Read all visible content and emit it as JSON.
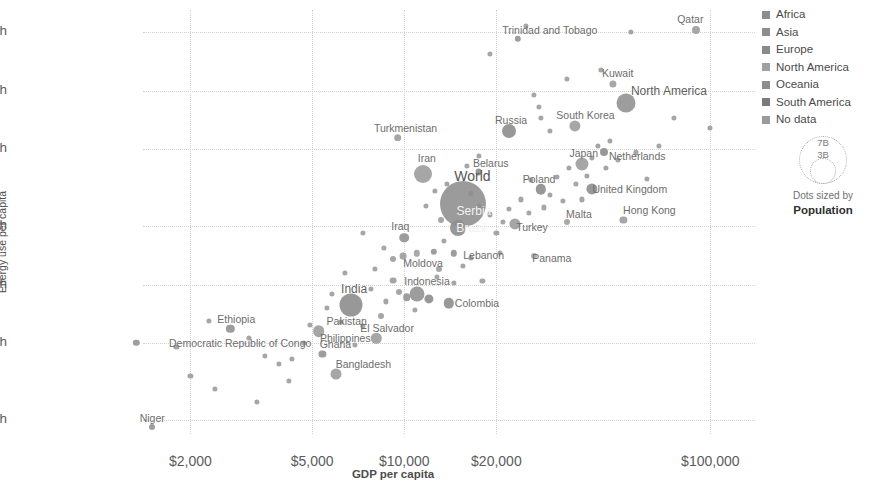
{
  "chart_data": {
    "type": "scatter",
    "title": "",
    "xlabel": "GDP per capita",
    "ylabel": "Energy use per capita",
    "xscale": "log",
    "yscale": "log",
    "xlim": [
      1400,
      140000
    ],
    "ylim": [
      1700,
      260000
    ],
    "grid": true,
    "xticks": [
      "$2,000",
      "$5,000",
      "$10,000",
      "$20,000",
      "$100,000"
    ],
    "xtick_values": [
      2000,
      5000,
      10000,
      20000,
      100000
    ],
    "yticks": [
      "200,000 kWh",
      "100,000 kWh",
      "50,000 kWh",
      "20,000 kWh",
      "10,000 kWh",
      "5,000 kWh",
      "2,000 kWh"
    ],
    "ytick_values": [
      200000,
      100000,
      50000,
      20000,
      10000,
      5000,
      2000
    ],
    "size_encoding": "Population",
    "legend_position": "right",
    "points": [
      {
        "label": "Niger",
        "x": 1500,
        "y": 1850,
        "r": 3.0,
        "c": "#8f8f8f",
        "lx": 0,
        "ly": -9
      },
      {
        "label": "Democratic Republic of Congo",
        "x": 1330,
        "y": 5000,
        "r": 3.2,
        "c": "#8f8f8f",
        "lx": 104,
        "ly": 0
      },
      {
        "label": "Ethiopia",
        "x": 2700,
        "y": 5900,
        "r": 4.2,
        "c": "#8f8f8f",
        "lx": 6,
        "ly": -10
      },
      {
        "label": "Bangladesh",
        "x": 6000,
        "y": 3450,
        "r": 5.5,
        "c": "#9a9a9a",
        "lx": 27,
        "ly": -10
      },
      {
        "label": "Ghana",
        "x": 5400,
        "y": 4400,
        "r": 3.6,
        "c": "#8f8f8f",
        "lx": 13,
        "ly": -10
      },
      {
        "label": "Pakistan",
        "x": 5250,
        "y": 5750,
        "r": 5.8,
        "c": "#9a9a9a",
        "lx": 28,
        "ly": -10
      },
      {
        "label": "India",
        "x": 6700,
        "y": 7900,
        "r": 11.5,
        "c": "#8a8a8a",
        "lx": 3,
        "ly": -16
      },
      {
        "label": "Philippines",
        "x": 8100,
        "y": 5300,
        "r": 5.2,
        "c": "#9a9a9a",
        "lx": -31,
        "ly": 0
      },
      {
        "label": "El Salvador",
        "x": 8400,
        "y": 6900,
        "r": 3.0,
        "c": "#9a9a9a",
        "lx": 6,
        "ly": 12
      },
      {
        "label": "Indonesia",
        "x": 11000,
        "y": 9000,
        "r": 7.5,
        "c": "#8f8f8f",
        "lx": 10,
        "ly": -13
      },
      {
        "label": "Colombia",
        "x": 14000,
        "y": 8000,
        "r": 5.2,
        "c": "#8a8a8a",
        "lx": 28,
        "ly": 0
      },
      {
        "label": "Moldova",
        "x": 11000,
        "y": 14500,
        "r": 3.2,
        "c": "#9d9d9d",
        "lx": 6,
        "ly": 10
      },
      {
        "label": "Iraq",
        "x": 10000,
        "y": 17500,
        "r": 4.8,
        "c": "#8f8f8f",
        "lx": -4,
        "ly": -12
      },
      {
        "label": "Lebanon",
        "x": 14500,
        "y": 14500,
        "r": 3.2,
        "c": "#8f8f8f",
        "lx": 30,
        "ly": 2
      },
      {
        "label": "Brazil",
        "x": 15000,
        "y": 19500,
        "r": 8.0,
        "c": "#8a8a8a",
        "lx": 13,
        "ly": 0
      },
      {
        "label": "Serbia",
        "x": 15200,
        "y": 24000,
        "r": 3.0,
        "c": "#9d9d9d",
        "lx": 14,
        "ly": 0
      },
      {
        "label": "World",
        "x": 15500,
        "y": 26000,
        "r": 23.0,
        "c": "#8d8d8d",
        "lx": 10,
        "ly": -28
      },
      {
        "label": "Iran",
        "x": 11500,
        "y": 37000,
        "r": 9.0,
        "c": "#9a9a9a",
        "lx": 4,
        "ly": -16
      },
      {
        "label": "Belarus",
        "x": 17500,
        "y": 38000,
        "r": 3.4,
        "c": "#8a8a8a",
        "lx": 12,
        "ly": -9
      },
      {
        "label": "Turkey",
        "x": 23000,
        "y": 20500,
        "r": 5.6,
        "c": "#9a9a9a",
        "lx": 17,
        "ly": 3
      },
      {
        "label": "Panama",
        "x": 26500,
        "y": 14000,
        "r": 3.0,
        "c": "#a5a5a5",
        "lx": 18,
        "ly": 2
      },
      {
        "label": "Malta",
        "x": 34000,
        "y": 21000,
        "r": 3.0,
        "c": "#9d9d9d",
        "lx": 12,
        "ly": -8
      },
      {
        "label": "Poland",
        "x": 28000,
        "y": 31000,
        "r": 5.2,
        "c": "#8a8a8a",
        "lx": -2,
        "ly": -10
      },
      {
        "label": "Turkmenistan",
        "x": 9500,
        "y": 57000,
        "r": 3.8,
        "c": "#9a9a9a",
        "lx": 8,
        "ly": -10
      },
      {
        "label": "Russia",
        "x": 22000,
        "y": 62000,
        "r": 7.0,
        "c": "#8a8a8a",
        "lx": 2,
        "ly": -11
      },
      {
        "label": "South Korea",
        "x": 36000,
        "y": 66000,
        "r": 5.6,
        "c": "#9a9a9a",
        "lx": 11,
        "ly": -11
      },
      {
        "label": "Netherlands",
        "x": 45000,
        "y": 48000,
        "r": 4.0,
        "c": "#8a8a8a",
        "lx": 33,
        "ly": 4
      },
      {
        "label": "Japan",
        "x": 38000,
        "y": 42000,
        "r": 6.5,
        "c": "#9a9a9a",
        "lx": 2,
        "ly": -11
      },
      {
        "label": "United Kingdom",
        "x": 41000,
        "y": 31000,
        "r": 5.6,
        "c": "#8a8a8a",
        "lx": 38,
        "ly": 0
      },
      {
        "label": "Hong Kong",
        "x": 52000,
        "y": 21500,
        "r": 3.6,
        "c": "#9a9a9a",
        "lx": 26,
        "ly": -10
      },
      {
        "label": "North America",
        "x": 53000,
        "y": 86000,
        "r": 9.5,
        "c": "#909090",
        "lx": 43,
        "ly": -12
      },
      {
        "label": "Kuwait",
        "x": 48000,
        "y": 108000,
        "r": 3.6,
        "c": "#9a9a9a",
        "lx": 5,
        "ly": -11
      },
      {
        "label": "Trinidad and Tobago",
        "x": 23500,
        "y": 185000,
        "r": 3.2,
        "c": "#8f8f8f",
        "lx": 32,
        "ly": -9
      },
      {
        "label": "Qatar",
        "x": 90000,
        "y": 205000,
        "r": 4.0,
        "c": "#9a9a9a",
        "lx": -6,
        "ly": -11
      }
    ],
    "unlabeled_points": [
      {
        "x": 1800,
        "y": 4800,
        "r": 2.6,
        "c": "#9a9a9a"
      },
      {
        "x": 2300,
        "y": 6500,
        "r": 2.6,
        "c": "#9a9a9a"
      },
      {
        "x": 3100,
        "y": 5300,
        "r": 2.6,
        "c": "#9a9a9a"
      },
      {
        "x": 3500,
        "y": 4300,
        "r": 2.6,
        "c": "#9a9a9a"
      },
      {
        "x": 3900,
        "y": 3900,
        "r": 2.6,
        "c": "#9a9a9a"
      },
      {
        "x": 4300,
        "y": 4150,
        "r": 2.6,
        "c": "#9a9a9a"
      },
      {
        "x": 4200,
        "y": 3200,
        "r": 2.6,
        "c": "#9a9a9a"
      },
      {
        "x": 4700,
        "y": 5000,
        "r": 2.6,
        "c": "#9a9a9a"
      },
      {
        "x": 4900,
        "y": 6200,
        "r": 2.6,
        "c": "#9a9a9a"
      },
      {
        "x": 5600,
        "y": 7600,
        "r": 2.6,
        "c": "#9a9a9a"
      },
      {
        "x": 6200,
        "y": 6400,
        "r": 2.6,
        "c": "#9a9a9a"
      },
      {
        "x": 6900,
        "y": 4900,
        "r": 2.6,
        "c": "#9a9a9a"
      },
      {
        "x": 7300,
        "y": 6100,
        "r": 2.6,
        "c": "#9a9a9a"
      },
      {
        "x": 7800,
        "y": 9500,
        "r": 2.6,
        "c": "#9a9a9a"
      },
      {
        "x": 8700,
        "y": 8200,
        "r": 2.6,
        "c": "#9a9a9a"
      },
      {
        "x": 9200,
        "y": 10500,
        "r": 3.4,
        "c": "#9a9a9a"
      },
      {
        "x": 9600,
        "y": 9200,
        "r": 3.0,
        "c": "#9a9a9a"
      },
      {
        "x": 10200,
        "y": 8600,
        "r": 3.8,
        "c": "#8f8f8f"
      },
      {
        "x": 10800,
        "y": 7400,
        "r": 2.6,
        "c": "#9a9a9a"
      },
      {
        "x": 12000,
        "y": 8400,
        "r": 4.6,
        "c": "#8a8a8a"
      },
      {
        "x": 12800,
        "y": 11000,
        "r": 2.6,
        "c": "#9a9a9a"
      },
      {
        "x": 9200,
        "y": 13500,
        "r": 3.0,
        "c": "#9a9a9a"
      },
      {
        "x": 8600,
        "y": 15500,
        "r": 2.6,
        "c": "#9a9a9a"
      },
      {
        "x": 9900,
        "y": 14000,
        "r": 3.4,
        "c": "#9a9a9a"
      },
      {
        "x": 12500,
        "y": 14800,
        "r": 3.2,
        "c": "#8f8f8f"
      },
      {
        "x": 13500,
        "y": 16800,
        "r": 2.6,
        "c": "#9a9a9a"
      },
      {
        "x": 13200,
        "y": 21500,
        "r": 3.0,
        "c": "#9a9a9a"
      },
      {
        "x": 11800,
        "y": 25500,
        "r": 2.6,
        "c": "#9a9a9a"
      },
      {
        "x": 12600,
        "y": 30500,
        "r": 2.6,
        "c": "#9a9a9a"
      },
      {
        "x": 13800,
        "y": 33000,
        "r": 2.6,
        "c": "#9a9a9a"
      },
      {
        "x": 16500,
        "y": 29500,
        "r": 2.6,
        "c": "#9a9a9a"
      },
      {
        "x": 17500,
        "y": 25500,
        "r": 2.6,
        "c": "#9a9a9a"
      },
      {
        "x": 19000,
        "y": 23000,
        "r": 2.6,
        "c": "#9a9a9a"
      },
      {
        "x": 20000,
        "y": 18500,
        "r": 2.6,
        "c": "#9a9a9a"
      },
      {
        "x": 21000,
        "y": 21000,
        "r": 2.6,
        "c": "#9a9a9a"
      },
      {
        "x": 22000,
        "y": 24500,
        "r": 2.6,
        "c": "#9a9a9a"
      },
      {
        "x": 24000,
        "y": 27500,
        "r": 2.6,
        "c": "#9a9a9a"
      },
      {
        "x": 25500,
        "y": 23500,
        "r": 2.6,
        "c": "#9a9a9a"
      },
      {
        "x": 26000,
        "y": 34500,
        "r": 2.6,
        "c": "#9a9a9a"
      },
      {
        "x": 28500,
        "y": 25000,
        "r": 2.6,
        "c": "#9a9a9a"
      },
      {
        "x": 30000,
        "y": 29000,
        "r": 2.6,
        "c": "#9a9a9a"
      },
      {
        "x": 31500,
        "y": 36000,
        "r": 2.6,
        "c": "#9a9a9a"
      },
      {
        "x": 33000,
        "y": 27000,
        "r": 2.6,
        "c": "#9a9a9a"
      },
      {
        "x": 34500,
        "y": 40000,
        "r": 2.6,
        "c": "#9a9a9a"
      },
      {
        "x": 36500,
        "y": 33000,
        "r": 2.6,
        "c": "#9a9a9a"
      },
      {
        "x": 38000,
        "y": 27500,
        "r": 2.6,
        "c": "#9a9a9a"
      },
      {
        "x": 39500,
        "y": 36500,
        "r": 2.6,
        "c": "#9a9a9a"
      },
      {
        "x": 41000,
        "y": 45000,
        "r": 2.6,
        "c": "#9a9a9a"
      },
      {
        "x": 43000,
        "y": 52000,
        "r": 2.6,
        "c": "#9a9a9a"
      },
      {
        "x": 45500,
        "y": 40000,
        "r": 2.6,
        "c": "#9a9a9a"
      },
      {
        "x": 47000,
        "y": 55000,
        "r": 2.6,
        "c": "#9a9a9a"
      },
      {
        "x": 50000,
        "y": 44000,
        "r": 2.6,
        "c": "#9a9a9a"
      },
      {
        "x": 57000,
        "y": 48000,
        "r": 2.6,
        "c": "#9a9a9a"
      },
      {
        "x": 62000,
        "y": 35000,
        "r": 2.6,
        "c": "#9a9a9a"
      },
      {
        "x": 68000,
        "y": 52000,
        "r": 2.6,
        "c": "#9a9a9a"
      },
      {
        "x": 76000,
        "y": 72000,
        "r": 2.6,
        "c": "#9a9a9a"
      },
      {
        "x": 100000,
        "y": 64000,
        "r": 2.6,
        "c": "#9a9a9a"
      },
      {
        "x": 30000,
        "y": 62000,
        "r": 2.6,
        "c": "#9a9a9a"
      },
      {
        "x": 28000,
        "y": 72000,
        "r": 2.6,
        "c": "#9a9a9a"
      },
      {
        "x": 27500,
        "y": 82000,
        "r": 2.6,
        "c": "#9a9a9a"
      },
      {
        "x": 26500,
        "y": 95000,
        "r": 2.6,
        "c": "#9a9a9a"
      },
      {
        "x": 34000,
        "y": 115000,
        "r": 2.6,
        "c": "#9a9a9a"
      },
      {
        "x": 19000,
        "y": 155000,
        "r": 2.6,
        "c": "#9a9a9a"
      },
      {
        "x": 44000,
        "y": 128000,
        "r": 2.6,
        "c": "#9a9a9a"
      },
      {
        "x": 25000,
        "y": 215000,
        "r": 2.6,
        "c": "#9a9a9a"
      },
      {
        "x": 17500,
        "y": 46000,
        "r": 2.6,
        "c": "#9a9a9a"
      },
      {
        "x": 16000,
        "y": 41000,
        "r": 2.6,
        "c": "#9a9a9a"
      },
      {
        "x": 7300,
        "y": 18500,
        "r": 2.6,
        "c": "#9a9a9a"
      },
      {
        "x": 8000,
        "y": 12000,
        "r": 2.6,
        "c": "#9a9a9a"
      },
      {
        "x": 6400,
        "y": 11500,
        "r": 2.6,
        "c": "#9a9a9a"
      },
      {
        "x": 5800,
        "y": 9000,
        "r": 2.6,
        "c": "#9a9a9a"
      },
      {
        "x": 15500,
        "y": 12500,
        "r": 2.6,
        "c": "#9a9a9a"
      },
      {
        "x": 16500,
        "y": 13800,
        "r": 2.6,
        "c": "#9a9a9a"
      },
      {
        "x": 13000,
        "y": 12000,
        "r": 3.0,
        "c": "#9a9a9a"
      },
      {
        "x": 14500,
        "y": 10200,
        "r": 2.6,
        "c": "#9a9a9a"
      },
      {
        "x": 18000,
        "y": 10500,
        "r": 2.6,
        "c": "#9a9a9a"
      },
      {
        "x": 20500,
        "y": 14500,
        "r": 2.6,
        "c": "#9a9a9a"
      },
      {
        "x": 2400,
        "y": 2900,
        "r": 2.6,
        "c": "#9a9a9a"
      },
      {
        "x": 2000,
        "y": 3400,
        "r": 2.6,
        "c": "#9a9a9a"
      },
      {
        "x": 3300,
        "y": 2500,
        "r": 2.6,
        "c": "#9a9a9a"
      },
      {
        "x": 55000,
        "y": 200000,
        "r": 2.6,
        "c": "#9a9a9a"
      }
    ]
  },
  "legend": {
    "items": [
      {
        "label": "Africa",
        "color": "#8d8d8d"
      },
      {
        "label": "Asia",
        "color": "#8d8d8d"
      },
      {
        "label": "Europe",
        "color": "#8a8a8a"
      },
      {
        "label": "North America",
        "color": "#a0a0a0"
      },
      {
        "label": "Oceania",
        "color": "#8d8d8d"
      },
      {
        "label": "South America",
        "color": "#7a7a7a"
      },
      {
        "label": "No data",
        "color": "#9b9b9b"
      }
    ],
    "size_legend": {
      "big_value": "7B",
      "small_value": "3B",
      "caption_line1": "Dots sized by",
      "caption_line2": "Population"
    }
  }
}
